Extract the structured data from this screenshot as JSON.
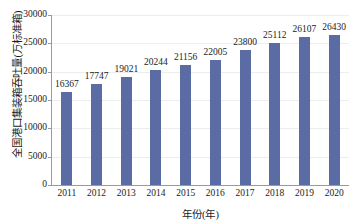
{
  "chart_data": {
    "type": "bar",
    "title": "",
    "xlabel": "年份(年)",
    "ylabel": "全国港口集装箱吞吐量(万标准箱)",
    "categories": [
      "2011",
      "2012",
      "2013",
      "2014",
      "2015",
      "2016",
      "2017",
      "2018",
      "2019",
      "2020"
    ],
    "values": [
      16367,
      17747,
      19021,
      20244,
      21156,
      22005,
      23800,
      25112,
      26107,
      26430
    ],
    "value_labels": [
      "16367",
      "17747",
      "19021",
      "20244",
      "21156",
      "22005",
      "23800",
      "25112",
      "26107",
      "26430"
    ],
    "ylim": [
      0,
      30000
    ],
    "ytick_values": [
      0,
      5000,
      10000,
      15000,
      20000,
      25000,
      30000
    ],
    "ytick_labels": [
      "0",
      "5000",
      "10000",
      "15000",
      "20000",
      "25000",
      "30000"
    ],
    "grid": true,
    "legend": null,
    "series": [
      {
        "name": "全国港口集装箱吞吐量",
        "color": "#5b6ca5",
        "values": [
          16367,
          17747,
          19021,
          20244,
          21156,
          22005,
          23800,
          25112,
          26107,
          26430
        ]
      }
    ]
  },
  "colors": {
    "bar": "#5b6ca5",
    "grid": "#ededf0",
    "axis": "#9a9a9a",
    "text": "#1b1b1b",
    "background": "#ffffff"
  }
}
